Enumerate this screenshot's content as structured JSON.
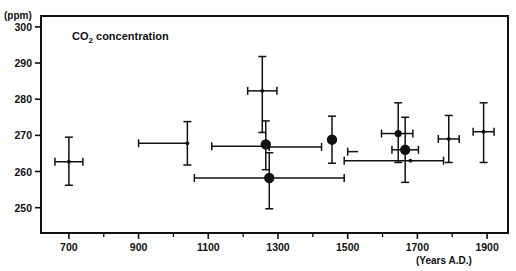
{
  "chart_data": {
    "type": "scatter",
    "title": "CO2 concentration",
    "title_main": "CO",
    "title_sub": "2",
    "title_rest": " concentration",
    "xlabel": "(Years A.D.)",
    "ylabel": "(ppm)",
    "xlim": [
      620,
      1960
    ],
    "ylim": [
      243,
      303
    ],
    "grid": false,
    "legend": null,
    "x_ticks": [
      700,
      900,
      1100,
      1300,
      1500,
      1700,
      1900
    ],
    "x_tick_labels": [
      "700",
      "900",
      "1100",
      "1300",
      "1500",
      "1700",
      "1900"
    ],
    "x_minor_ticks": [
      800,
      1000,
      1200,
      1400,
      1600,
      1800
    ],
    "y_ticks": [
      250,
      260,
      270,
      280,
      290,
      300
    ],
    "y_tick_labels": [
      "250",
      "260",
      "270",
      "280",
      "290",
      "300"
    ],
    "points": [
      {
        "name": "point-700",
        "x": 700,
        "y": 262.7,
        "xerr_lo": 40,
        "xerr_hi": 40,
        "yerr_lo": 6.5,
        "yerr_hi": 6.8,
        "marker": "small"
      },
      {
        "name": "point-1040",
        "x": 1040,
        "y": 267.8,
        "xerr_lo": 140,
        "xerr_hi": 0,
        "yerr_lo": 6.0,
        "yerr_hi": 6.0,
        "marker": "small"
      },
      {
        "name": "point-1190",
        "x": 1190,
        "y": 267.0,
        "xerr_lo": 80,
        "xerr_hi": 85,
        "yerr_lo": 0,
        "yerr_hi": 0,
        "marker": "none"
      },
      {
        "name": "point-1255-high",
        "x": 1255,
        "y": 282.3,
        "xerr_lo": 42,
        "xerr_hi": 42,
        "yerr_lo": 11.5,
        "yerr_hi": 9.5,
        "marker": "small"
      },
      {
        "name": "point-1265-mid",
        "x": 1265,
        "y": 267.5,
        "xerr_lo": 0,
        "xerr_hi": 0,
        "yerr_lo": 7.0,
        "yerr_hi": 6.5,
        "marker": "large"
      },
      {
        "name": "point-1275-low",
        "x": 1275,
        "y": 258.2,
        "xerr_lo": 215,
        "xerr_hi": 215,
        "yerr_lo": 8.5,
        "yerr_hi": 7.0,
        "marker": "large"
      },
      {
        "name": "point-1350",
        "x": 1350,
        "y": 266.8,
        "xerr_lo": 75,
        "xerr_hi": 75,
        "yerr_lo": 0,
        "yerr_hi": 0,
        "marker": "none"
      },
      {
        "name": "point-1455",
        "x": 1455,
        "y": 268.8,
        "xerr_lo": 0,
        "xerr_hi": 0,
        "yerr_lo": 6.5,
        "yerr_hi": 6.5,
        "marker": "large"
      },
      {
        "name": "point-1530",
        "x": 1530,
        "y": 265.5,
        "xerr_lo": 30,
        "xerr_hi": 0,
        "yerr_lo": 0,
        "yerr_hi": 0,
        "marker": "none"
      },
      {
        "name": "point-1645",
        "x": 1645,
        "y": 270.5,
        "xerr_lo": 48,
        "xerr_hi": 42,
        "yerr_lo": 8.0,
        "yerr_hi": 8.5,
        "marker": "medium"
      },
      {
        "name": "point-1665",
        "x": 1665,
        "y": 266.0,
        "xerr_lo": 38,
        "xerr_hi": 38,
        "yerr_lo": 9.0,
        "yerr_hi": 9.0,
        "marker": "large"
      },
      {
        "name": "point-1680",
        "x": 1680,
        "y": 263.0,
        "xerr_lo": 190,
        "xerr_hi": 95,
        "yerr_lo": 0,
        "yerr_hi": 0,
        "marker": "small"
      },
      {
        "name": "point-1790",
        "x": 1790,
        "y": 269.0,
        "xerr_lo": 30,
        "xerr_hi": 30,
        "yerr_lo": 6.5,
        "yerr_hi": 6.5,
        "marker": "small"
      },
      {
        "name": "point-1890",
        "x": 1890,
        "y": 271.0,
        "xerr_lo": 30,
        "xerr_hi": 30,
        "yerr_lo": 8.5,
        "yerr_hi": 8.0,
        "marker": "small"
      }
    ],
    "colors": {
      "ink": "#111111",
      "background": "#ffffff"
    }
  }
}
